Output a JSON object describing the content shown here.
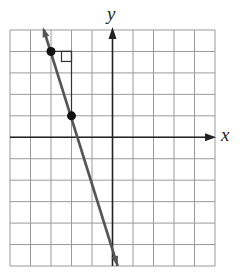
{
  "chart_data": {
    "type": "line",
    "title": "",
    "xlabel": "x",
    "ylabel": "y",
    "xlim": [
      -5,
      5
    ],
    "ylim": [
      -6,
      5
    ],
    "grid": true,
    "grid_step": 1,
    "tick_labels": false,
    "series": [
      {
        "name": "line",
        "equation": "y = -3x - 5",
        "slope": -3,
        "y_intercept": -5,
        "from": [
          -3.35,
          5
        ],
        "to": [
          0.25,
          -6
        ],
        "arrows": "both"
      }
    ],
    "points": [
      {
        "x": -3,
        "y": 4
      },
      {
        "x": -2,
        "y": 1
      }
    ],
    "annotations": [
      {
        "type": "slope-triangle",
        "from": [
          -3,
          4
        ],
        "corner": [
          -2,
          4
        ],
        "to": [
          -2,
          1
        ],
        "right_angle_at": [
          -2,
          4
        ]
      }
    ]
  },
  "labels": {
    "x": "x",
    "y": "y"
  }
}
